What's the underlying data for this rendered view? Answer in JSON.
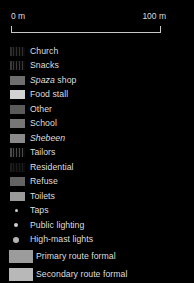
{
  "scalebar": {
    "min_label": "0 m",
    "max_label": "100 m"
  },
  "legend": {
    "items": [
      {
        "label": "Church",
        "marker": "swatch",
        "color": "#2e2e2e",
        "pattern": "vertical-stripes"
      },
      {
        "label": "Snacks",
        "marker": "swatch",
        "color": "#3a3a3a",
        "pattern": "vertical-stripes"
      },
      {
        "label": "Spaza shop",
        "marker": "swatch",
        "color": "#6e6e6e",
        "pattern": "solid",
        "italic_prefix": "Spaza",
        "plain_suffix": " shop"
      },
      {
        "label": "Food stall",
        "marker": "swatch",
        "color": "#d2d2d2",
        "pattern": "solid"
      },
      {
        "label": "Other",
        "marker": "swatch",
        "color": "#5a5a5a",
        "pattern": "solid"
      },
      {
        "label": "School",
        "marker": "swatch",
        "color": "#767676",
        "pattern": "solid"
      },
      {
        "label": "Shebeen",
        "marker": "swatch",
        "color": "#8a8a8a",
        "pattern": "solid",
        "italic": true
      },
      {
        "label": "Tailors",
        "marker": "swatch",
        "color": "#4a4a4a",
        "pattern": "vertical-stripes"
      },
      {
        "label": "Residential",
        "marker": "swatch",
        "color": "#1c1c1c",
        "pattern": "vertical-stripes"
      },
      {
        "label": "Refuse",
        "marker": "swatch",
        "color": "#636363",
        "pattern": "solid"
      },
      {
        "label": "Toilets",
        "marker": "swatch",
        "color": "#9a9a9a",
        "pattern": "solid"
      },
      {
        "label": "Taps",
        "marker": "dot",
        "color": "#c9c9c9",
        "size": 3
      },
      {
        "label": "Public lighting",
        "marker": "dot",
        "color": "#cfcfcf",
        "size": 4
      },
      {
        "label": "High-mast lights",
        "marker": "dot",
        "color": "#b4b4b4",
        "size": 6
      },
      {
        "label": "Primary route formal",
        "marker": "route",
        "color": "#9c9c9c"
      },
      {
        "label": "Secondary route formal",
        "marker": "route",
        "color": "#b8b8b8"
      }
    ]
  },
  "colors": {
    "background": "#000000",
    "text": "#dedede",
    "rule": "#c8c8c8"
  }
}
